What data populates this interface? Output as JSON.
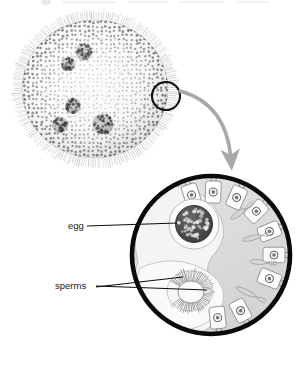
{
  "figure": {
    "background_color": "#ffffff",
    "width": 308,
    "height": 366
  },
  "colony": {
    "name": "volvox-colony",
    "description": "Spherical Volvox colony shown in grayscale light micrograph style",
    "center_x": 95,
    "center_y": 89,
    "radius_x": 75,
    "radius_y": 71,
    "body_fill": "#fbfbfb",
    "cell_dot_color": "#6d6d70",
    "flagella_color": "#9a9a9d",
    "daughter_colonies": [
      {
        "cx": 84,
        "cy": 52,
        "r": 8.5
      },
      {
        "cx": 68,
        "cy": 64,
        "r": 7.0
      },
      {
        "cx": 73,
        "cy": 106,
        "r": 8.0
      },
      {
        "cx": 60,
        "cy": 125,
        "r": 8.0
      },
      {
        "cx": 103,
        "cy": 124,
        "r": 10.5
      }
    ]
  },
  "callout": {
    "name": "callout-circle",
    "cx": 166,
    "cy": 96,
    "r": 14,
    "stroke_color": "#111111",
    "stroke_width": 2.1
  },
  "arrow": {
    "name": "magnify-arrow",
    "color": "#a8a8ab",
    "start_x": 178,
    "start_y": 92,
    "end_x": 232,
    "end_y": 171,
    "width": 3.4
  },
  "detail": {
    "name": "magnified-detail",
    "cx": 211,
    "cy": 255,
    "r": 82,
    "ring_color": "#0a0a0a",
    "ring_width": 4.6,
    "interior_fill": "#dedede",
    "matrix_fill": "#f2f2f2"
  },
  "egg": {
    "name": "egg-structure",
    "cx": 194,
    "cy": 224,
    "r": 18,
    "halo_r": 24,
    "body_fill": "#4a4a4c",
    "speck_color": "#e8e8e8",
    "halo_fill": "#fafafa"
  },
  "sperms": {
    "name": "sperm-packet",
    "cx": 190,
    "cy": 291,
    "r": 22,
    "flagella_color": "#5f5f62",
    "body_fill": "#f6f6f6"
  },
  "somatic_cells": {
    "name": "somatic-cell-layer",
    "outline_color": "#8c8c90",
    "nucleus_color": "#58585b",
    "count": 9
  },
  "labels": [
    {
      "id": "egg",
      "text": "egg",
      "text_x": 68,
      "text_y": 226,
      "leader": [
        {
          "x": 86,
          "y": 226
        },
        {
          "x": 176,
          "y": 224
        }
      ]
    },
    {
      "id": "sperms",
      "text": "sperms",
      "text_x": 55,
      "text_y": 286,
      "leader_a": [
        {
          "x": 95,
          "y": 286
        },
        {
          "x": 206,
          "y": 289
        }
      ],
      "leader_b": [
        {
          "x": 95,
          "y": 287
        },
        {
          "x": 182,
          "y": 278
        }
      ]
    }
  ],
  "top_fragment": {
    "name": "cropped-header-fragment",
    "visible": true,
    "color": "#e9e9ec"
  }
}
